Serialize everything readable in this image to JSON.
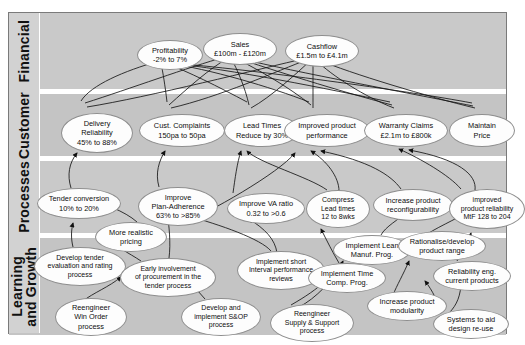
{
  "diagram": {
    "type": "strategy-map",
    "perspectives": [
      {
        "id": "financial",
        "label": "Financial"
      },
      {
        "id": "customer",
        "label": "Customer"
      },
      {
        "id": "processes",
        "label": "Processes"
      },
      {
        "id": "learning",
        "label": "Learning\nand Growth"
      }
    ],
    "nodes": [
      {
        "id": "profitability",
        "perspective": "financial",
        "label": "Profitability\n-2% to 7%",
        "x": 128,
        "y": 27,
        "w": 66,
        "h": 30
      },
      {
        "id": "sales",
        "perspective": "financial",
        "label": "Sales\n£100m - £120m",
        "x": 194,
        "y": 20,
        "w": 74,
        "h": 32
      },
      {
        "id": "cashflow",
        "perspective": "financial",
        "label": "Cashflow\n£1.5m to £4.1m",
        "x": 276,
        "y": 22,
        "w": 74,
        "h": 32
      },
      {
        "id": "delivery",
        "perspective": "customer",
        "label": "Delivery\nReliability\n45% to 88%",
        "x": 52,
        "y": 100,
        "w": 72,
        "h": 40
      },
      {
        "id": "complaints",
        "perspective": "customer",
        "label": "Cust. Complaints\n150pa to 50pa",
        "x": 130,
        "y": 101,
        "w": 86,
        "h": 33
      },
      {
        "id": "leadtimes",
        "perspective": "customer",
        "label": "Lead Times\nReduce by 30%",
        "x": 215,
        "y": 101,
        "w": 76,
        "h": 33
      },
      {
        "id": "improvedperf",
        "perspective": "customer",
        "label": "Improved product\nperformance",
        "x": 275,
        "y": 101,
        "w": 86,
        "h": 33
      },
      {
        "id": "warranty",
        "perspective": "customer",
        "label": "Warranty Claims\n£2.1m to £800k",
        "x": 355,
        "y": 101,
        "w": 84,
        "h": 33
      },
      {
        "id": "maintainprice",
        "perspective": "customer",
        "label": "Maintain\nPrice",
        "x": 440,
        "y": 101,
        "w": 66,
        "h": 33
      },
      {
        "id": "tenderconv",
        "perspective": "processes",
        "label": "Tender conversion\n10% to 20%",
        "x": 28,
        "y": 175,
        "w": 84,
        "h": 31
      },
      {
        "id": "planadherence",
        "perspective": "processes",
        "label": "Improve\nPlan-Adherence\n63% to >85%",
        "x": 129,
        "y": 174,
        "w": 80,
        "h": 39
      },
      {
        "id": "varatio",
        "perspective": "processes",
        "label": "Improve VA ratio\n0.32 to >0.6",
        "x": 218,
        "y": 180,
        "w": 78,
        "h": 31
      },
      {
        "id": "compress",
        "perspective": "processes",
        "label": "Compress\nLead times\n12 to 8wks",
        "x": 297,
        "y": 177,
        "w": 64,
        "h": 38
      },
      {
        "id": "reconfig",
        "perspective": "processes",
        "label": "Increase product\nreconfigurability",
        "x": 364,
        "y": 176,
        "w": 80,
        "h": 32
      },
      {
        "id": "reliability",
        "perspective": "processes",
        "label": "improved\nproduct reliability\nMtF 128 to 204",
        "x": 440,
        "y": 176,
        "w": 76,
        "h": 40
      },
      {
        "id": "realisticpricing",
        "perspective": "processes",
        "label": "More realistic\npricing",
        "x": 86,
        "y": 209,
        "w": 72,
        "h": 30
      },
      {
        "id": "leanmanuf",
        "perspective": "processes",
        "label": "Implement Lean\nManuf. Prog.",
        "x": 324,
        "y": 222,
        "w": 78,
        "h": 30
      },
      {
        "id": "rationalise",
        "perspective": "processes",
        "label": "Rationalise/develop\nproduct range",
        "x": 389,
        "y": 218,
        "w": 88,
        "h": 30
      },
      {
        "id": "developtender",
        "perspective": "learning",
        "label": "Develop tender\nevaluation and rating\nprocess",
        "x": 25,
        "y": 234,
        "w": 92,
        "h": 39
      },
      {
        "id": "earlyproc",
        "perspective": "learning",
        "label": "Early involvement\nof procurement in the\ntender process",
        "x": 111,
        "y": 245,
        "w": 96,
        "h": 39
      },
      {
        "id": "shortinterval",
        "perspective": "learning",
        "label": "Implement short\nInterval performance\nreviews",
        "x": 228,
        "y": 238,
        "w": 88,
        "h": 39
      },
      {
        "id": "timecomp",
        "perspective": "learning",
        "label": "Implement Time\nComp. Prog.",
        "x": 299,
        "y": 250,
        "w": 78,
        "h": 30
      },
      {
        "id": "reliabilityeng",
        "perspective": "learning",
        "label": "Reliability eng.\ncurrent products",
        "x": 424,
        "y": 248,
        "w": 78,
        "h": 30
      },
      {
        "id": "winorder",
        "perspective": "learning",
        "label": "Reengineer\nWin Order\nprocess",
        "x": 46,
        "y": 285,
        "w": 72,
        "h": 38
      },
      {
        "id": "sandop",
        "perspective": "learning",
        "label": "Develop and\nimplement S&OP\nprocess",
        "x": 172,
        "y": 285,
        "w": 80,
        "h": 38
      },
      {
        "id": "supplysupport",
        "perspective": "learning",
        "label": "Reengineer\nSupply & Support\nprocess",
        "x": 261,
        "y": 291,
        "w": 84,
        "h": 38
      },
      {
        "id": "modularity",
        "perspective": "learning",
        "label": "Increase product\nmodularity",
        "x": 358,
        "y": 278,
        "w": 80,
        "h": 30
      },
      {
        "id": "designreuse",
        "perspective": "learning",
        "label": "Systems to aid\ndesign re-use",
        "x": 424,
        "y": 296,
        "w": 76,
        "h": 30
      }
    ]
  }
}
